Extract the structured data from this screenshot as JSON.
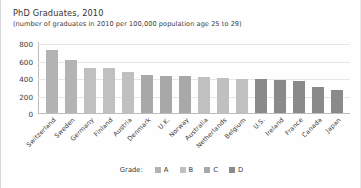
{
  "chart_data": {
    "type": "bar",
    "title": "PhD Graduates, 2010",
    "subtitle": "(number of graduates in 2010 per 100,000 population age 25 to 29)",
    "xlabel": "",
    "ylabel": "",
    "ylim": [
      0,
      800
    ],
    "yticks": [
      800,
      600,
      400,
      200,
      0
    ],
    "grid": true,
    "legend_position": "bottom-center",
    "legend_title": "Grade:",
    "categories": [
      "Switzerland",
      "Sweden",
      "Germany",
      "Finland",
      "Austria",
      "Denmark",
      "U.K.",
      "Norway",
      "Australia",
      "Netherlands",
      "Belgium",
      "U.S.",
      "Ireland",
      "France",
      "Canada",
      "Japan"
    ],
    "values": [
      735,
      620,
      520,
      520,
      470,
      440,
      430,
      425,
      420,
      410,
      400,
      390,
      385,
      375,
      300,
      265
    ],
    "grades": [
      "A",
      "A",
      "B",
      "B",
      "B",
      "C",
      "C",
      "C",
      "B",
      "B",
      "B",
      "D",
      "D",
      "D",
      "D",
      "D"
    ],
    "series": [
      {
        "name": "Grade",
        "values": [
          735,
          620,
          520,
          520,
          470,
          440,
          430,
          425,
          420,
          410,
          400,
          390,
          385,
          375,
          300,
          265
        ]
      }
    ]
  },
  "legend": {
    "title": "Grade:",
    "entries": [
      {
        "label": "A",
        "color": "#b3b3b3"
      },
      {
        "label": "B",
        "color": "#c0c0c0"
      },
      {
        "label": "C",
        "color": "#a8a8a8"
      },
      {
        "label": "D",
        "color": "#8a8a8a"
      }
    ]
  },
  "colors": {
    "grade_a": "#b3b3b3",
    "grade_b": "#c0c0c0",
    "grade_c": "#a8a8a8",
    "grade_d": "#8a8a8a",
    "axis": "#bdbdbd",
    "grid": "#e6e6e6",
    "text": "#3c3c3c"
  }
}
